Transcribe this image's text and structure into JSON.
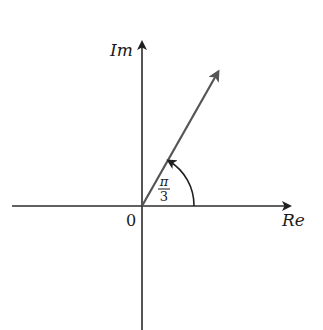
{
  "diagram": {
    "type": "complex-plane-argand",
    "axes": {
      "real_label": "Re",
      "imaginary_label": "Im",
      "origin_label": "0"
    },
    "vector": {
      "angle_radians": "π/3",
      "angle_numerator": "π",
      "angle_denominator": "3"
    },
    "colors": {
      "axis": "#2b2b2b",
      "vector": "#555555",
      "text": "#1a1a1a"
    }
  }
}
